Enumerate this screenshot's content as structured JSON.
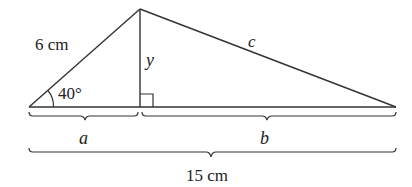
{
  "diagram": {
    "labels": {
      "left_side": "6 cm",
      "angle": "40°",
      "altitude": "y",
      "right_side": "c",
      "segment_a": "a",
      "segment_b": "b",
      "total_base": "15 cm"
    },
    "points": {
      "left_vertex": [
        29,
        107
      ],
      "apex": [
        140,
        9
      ],
      "foot": [
        140,
        107
      ],
      "right_vertex": [
        396,
        107
      ]
    },
    "colors": {
      "stroke": "#333333",
      "text": "#222222",
      "background": "#ffffff"
    }
  }
}
